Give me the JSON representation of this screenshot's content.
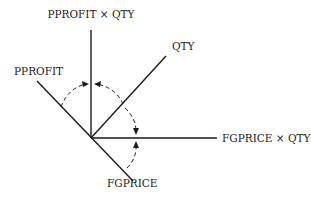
{
  "diagram": {
    "type": "vector-rotation-diagram",
    "origin": {
      "x": 91,
      "y": 138
    },
    "axes": [
      {
        "id": "pprofit_x_qty",
        "label": "PPROFIT × QTY",
        "end": {
          "x": 91,
          "y": 30
        },
        "label_pos": {
          "x": 91,
          "y": 18
        },
        "anchor": "middle"
      },
      {
        "id": "qty",
        "label": "QTY",
        "end": {
          "x": 166,
          "y": 56
        },
        "label_pos": {
          "x": 172,
          "y": 50
        },
        "anchor": "start"
      },
      {
        "id": "fgprice_x_qty",
        "label": "FGPRICE × QTY",
        "end": {
          "x": 217,
          "y": 138
        },
        "label_pos": {
          "x": 222,
          "y": 142
        },
        "anchor": "start"
      },
      {
        "id": "pprofit",
        "label": "PPROFIT",
        "end": {
          "x": 37,
          "y": 81
        },
        "label_pos": {
          "x": 14,
          "y": 75
        },
        "anchor": "start"
      },
      {
        "id": "fgprice",
        "label": "FGPRICE",
        "end": {
          "x": 133,
          "y": 181
        },
        "label_pos": {
          "x": 107,
          "y": 187
        },
        "anchor": "start"
      }
    ],
    "rotations": [
      {
        "from": "pprofit",
        "to": "pprofit_x_qty",
        "description": "dashed arc with arrow toward vertical axis"
      },
      {
        "from": "qty",
        "to": "pprofit_x_qty",
        "description": "dashed arc with arrow toward vertical axis"
      },
      {
        "from": "qty",
        "to": "fgprice_x_qty",
        "description": "dashed arc with arrow toward horizontal axis"
      },
      {
        "from": "fgprice",
        "to": "fgprice_x_qty",
        "description": "dashed arc with arrow toward horizontal axis"
      }
    ]
  },
  "labels": {
    "pprofit_x_qty": "PPROFIT × QTY",
    "qty": "QTY",
    "fgprice_x_qty": "FGPRICE × QTY",
    "pprofit": "PPROFIT",
    "fgprice": "FGPRICE"
  }
}
